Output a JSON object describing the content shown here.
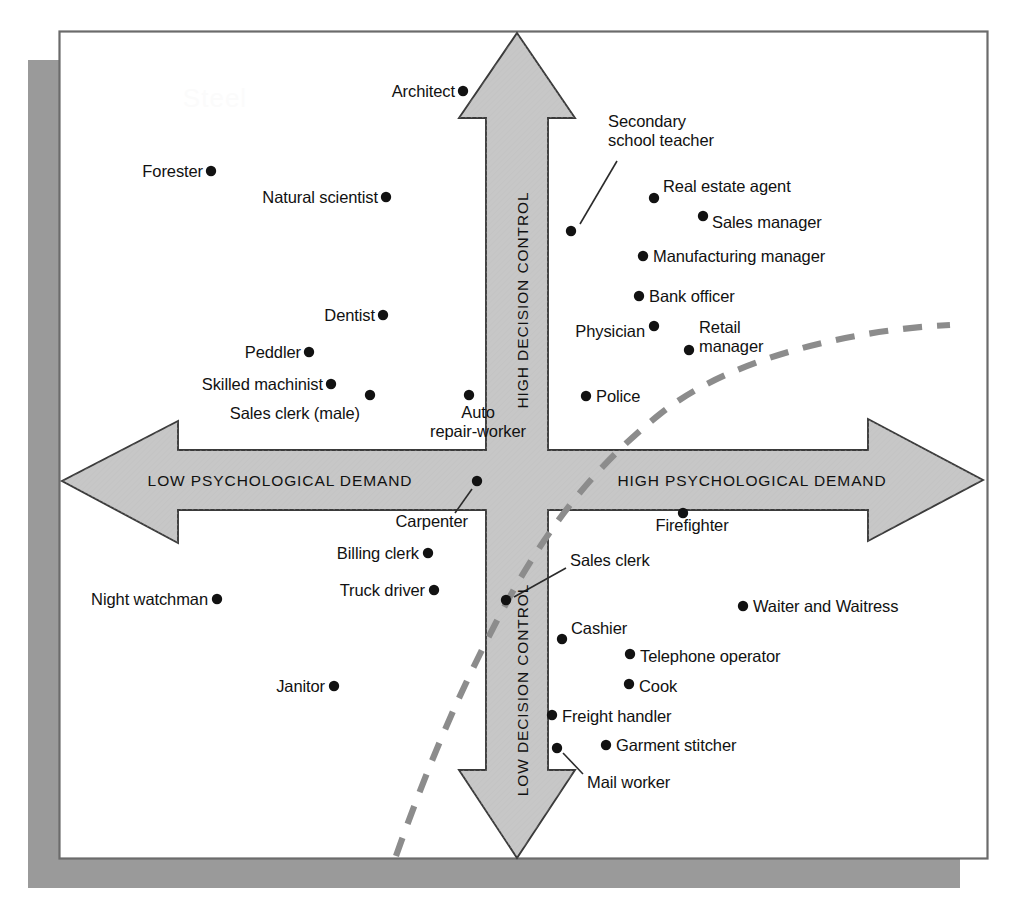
{
  "figure": {
    "title_watermark": "Steel",
    "background_color": "#ffffff",
    "frame_color": "#6b6b6b",
    "shadow_color": "#9a9a9a",
    "arrow_fill": "#c7c7c7",
    "arrow_stroke": "#3a3a3a",
    "dot_color": "#121212",
    "curve_color": "#8c8c8c",
    "leader_color": "#2b2b2b"
  },
  "axes": {
    "vertical_top_label": "HIGH DECISION CONTROL",
    "vertical_bottom_label": "LOW DECISION CONTROL",
    "horizontal_left_label": "LOW PSYCHOLOGICAL DEMAND",
    "horizontal_right_label": "HIGH PSYCHOLOGICAL DEMAND"
  },
  "chart_data": {
    "type": "scatter",
    "xlabel": "Psychological Demand",
    "ylabel": "Decision Control",
    "grid": false,
    "legend": null,
    "annotations": [
      "HIGH DECISION CONTROL",
      "LOW DECISION CONTROL",
      "LOW PSYCHOLOGICAL DEMAND",
      "HIGH PSYCHOLOGICAL DEMAND"
    ],
    "quadrants": [
      "low demand / high control",
      "high demand / high control",
      "low demand / low control",
      "high demand / low control"
    ],
    "diagonal_note": "dashed strain diagonal running from lower-left to upper-right",
    "points": [
      {
        "label": "Architect",
        "x": 463,
        "y": 91,
        "lx": 455,
        "ly": 91,
        "align": "r",
        "lines": [
          "Architect"
        ]
      },
      {
        "label": "Forester",
        "x": 211,
        "y": 171,
        "lx": 203,
        "ly": 171,
        "align": "r",
        "lines": [
          "Forester"
        ]
      },
      {
        "label": "Natural scientist",
        "x": 386,
        "y": 197,
        "lx": 378,
        "ly": 197,
        "align": "r",
        "lines": [
          "Natural scientist"
        ]
      },
      {
        "label": "Dentist",
        "x": 383,
        "y": 315,
        "lx": 375,
        "ly": 315,
        "align": "r",
        "lines": [
          "Dentist"
        ]
      },
      {
        "label": "Peddler",
        "x": 309,
        "y": 352,
        "lx": 301,
        "ly": 352,
        "align": "r",
        "lines": [
          "Peddler"
        ]
      },
      {
        "label": "Skilled machinist",
        "x": 331,
        "y": 384,
        "lx": 323,
        "ly": 384,
        "align": "r",
        "lines": [
          "Skilled machinist"
        ]
      },
      {
        "label": "Sales clerk (male)",
        "x": 370,
        "y": 395,
        "lx": 360,
        "ly": 413,
        "align": "r",
        "lines": [
          "Sales clerk (male)"
        ]
      },
      {
        "label": "Auto repair-worker",
        "x": 469,
        "y": 395,
        "lx": 478,
        "ly": 422,
        "align": "c2",
        "lines": [
          "Auto",
          "repair-worker"
        ]
      },
      {
        "label": "Secondary school teacher",
        "x": 571,
        "y": 231,
        "lx": 608,
        "ly": 131,
        "align": "l2",
        "lines": [
          "Secondary",
          "school teacher"
        ],
        "leader": [
          580,
          224,
          617,
          161
        ]
      },
      {
        "label": "Real estate agent",
        "x": 654,
        "y": 198,
        "lx": 663,
        "ly": 186,
        "align": "l",
        "lines": [
          "Real estate agent"
        ]
      },
      {
        "label": "Sales manager",
        "x": 703,
        "y": 216,
        "lx": 712,
        "ly": 222,
        "align": "l",
        "lines": [
          "Sales manager"
        ]
      },
      {
        "label": "Manufacturing manager",
        "x": 643,
        "y": 256,
        "lx": 653,
        "ly": 256,
        "align": "l",
        "lines": [
          "Manufacturing manager"
        ]
      },
      {
        "label": "Bank officer",
        "x": 639,
        "y": 296,
        "lx": 649,
        "ly": 296,
        "align": "l",
        "lines": [
          "Bank officer"
        ]
      },
      {
        "label": "Physician",
        "x": 654,
        "y": 326,
        "lx": 645,
        "ly": 331,
        "align": "r",
        "lines": [
          "Physician"
        ]
      },
      {
        "label": "Retail manager",
        "x": 689,
        "y": 350,
        "lx": 699,
        "ly": 337,
        "align": "l2",
        "lines": [
          "Retail",
          "manager"
        ]
      },
      {
        "label": "Police",
        "x": 586,
        "y": 396,
        "lx": 596,
        "ly": 396,
        "align": "l",
        "lines": [
          "Police"
        ]
      },
      {
        "label": "Carpenter",
        "x": 477,
        "y": 481,
        "lx": 468,
        "ly": 521,
        "align": "r",
        "lines": [
          "Carpenter"
        ],
        "leader": [
          472,
          489,
          455,
          513
        ]
      },
      {
        "label": "Billing clerk",
        "x": 428,
        "y": 553,
        "lx": 419,
        "ly": 553,
        "align": "r",
        "lines": [
          "Billing clerk"
        ]
      },
      {
        "label": "Truck driver",
        "x": 434,
        "y": 590,
        "lx": 425,
        "ly": 590,
        "align": "r",
        "lines": [
          "Truck driver"
        ]
      },
      {
        "label": "Night watchman",
        "x": 217,
        "y": 599,
        "lx": 208,
        "ly": 599,
        "align": "r",
        "lines": [
          "Night watchman"
        ]
      },
      {
        "label": "Janitor",
        "x": 334,
        "y": 686,
        "lx": 325,
        "ly": 686,
        "align": "r",
        "lines": [
          "Janitor"
        ]
      },
      {
        "label": "Firefighter",
        "x": 683,
        "y": 513,
        "lx": 692,
        "ly": 525,
        "align": "c",
        "lines": [
          "Firefighter"
        ]
      },
      {
        "label": "Sales clerk",
        "x": 506,
        "y": 600,
        "lx": 570,
        "ly": 560,
        "align": "l",
        "lines": [
          "Sales clerk"
        ],
        "leader": [
          514,
          597,
          566,
          568
        ]
      },
      {
        "label": "Cashier",
        "x": 562,
        "y": 639,
        "lx": 571,
        "ly": 628,
        "align": "l",
        "lines": [
          "Cashier"
        ]
      },
      {
        "label": "Telephone operator",
        "x": 630,
        "y": 654,
        "lx": 640,
        "ly": 656,
        "align": "l",
        "lines": [
          "Telephone operator"
        ]
      },
      {
        "label": "Cook",
        "x": 629,
        "y": 684,
        "lx": 639,
        "ly": 686,
        "align": "l",
        "lines": [
          "Cook"
        ]
      },
      {
        "label": "Waiter and Waitress",
        "x": 743,
        "y": 606,
        "lx": 753,
        "ly": 606,
        "align": "l",
        "lines": [
          "Waiter and Waitress"
        ]
      },
      {
        "label": "Freight handler",
        "x": 552,
        "y": 715,
        "lx": 562,
        "ly": 716,
        "align": "l",
        "lines": [
          "Freight handler"
        ]
      },
      {
        "label": "Garment stitcher",
        "x": 606,
        "y": 745,
        "lx": 616,
        "ly": 745,
        "align": "l",
        "lines": [
          "Garment stitcher"
        ]
      },
      {
        "label": "Mail worker",
        "x": 557,
        "y": 748,
        "lx": 587,
        "ly": 782,
        "align": "l",
        "lines": [
          "Mail worker"
        ],
        "leader": [
          563,
          753,
          583,
          774
        ]
      }
    ]
  }
}
